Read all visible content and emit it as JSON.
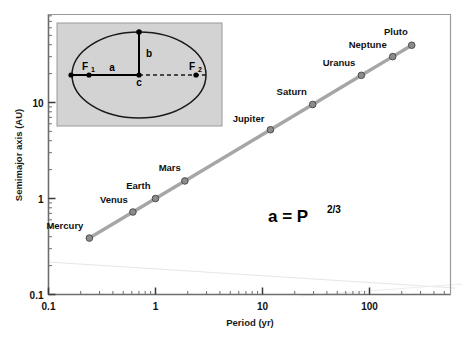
{
  "chart_data": {
    "type": "scatter",
    "title": "",
    "xlabel": "Period (yr)",
    "ylabel": "Semimajor axis (AU)",
    "xscale": "log",
    "yscale": "log",
    "xlim": [
      0.1,
      300
    ],
    "ylim": [
      0.1,
      60
    ],
    "grid": false,
    "legend": null,
    "annotations": [
      {
        "name": "kepler-law",
        "base": "a = P",
        "exponent": "2/3"
      }
    ],
    "xticks": [
      {
        "value": 0.1,
        "label": "0.1"
      },
      {
        "value": 1,
        "label": "1"
      },
      {
        "value": 10,
        "label": "10"
      },
      {
        "value": 100,
        "label": "100"
      }
    ],
    "yticks": [
      {
        "value": 0.1,
        "label": "0.1"
      },
      {
        "value": 1,
        "label": "1"
      },
      {
        "value": 10,
        "label": "10"
      }
    ],
    "series": [
      {
        "name": "Planets",
        "points": [
          {
            "label": "Mercury",
            "x": 0.241,
            "y": 0.387
          },
          {
            "label": "Venus",
            "x": 0.615,
            "y": 0.723
          },
          {
            "label": "Earth",
            "x": 1.0,
            "y": 1.0
          },
          {
            "label": "Mars",
            "x": 1.881,
            "y": 1.524
          },
          {
            "label": "Jupiter",
            "x": 11.86,
            "y": 5.203
          },
          {
            "label": "Saturn",
            "x": 29.46,
            "y": 9.537
          },
          {
            "label": "Uranus",
            "x": 84.01,
            "y": 19.19
          },
          {
            "label": "Neptune",
            "x": 164.8,
            "y": 30.07
          },
          {
            "label": "Pluto",
            "x": 248.1,
            "y": 39.48
          }
        ]
      }
    ]
  },
  "inset": {
    "name": "ellipse-diagram",
    "labels": {
      "semimajor": "a",
      "semiminor": "b",
      "center": "c",
      "focus1": "F",
      "focus1_sub": "1",
      "focus2": "F",
      "focus2_sub": "2"
    },
    "background_color": "#d3d3d3",
    "border_color": "#9a9a9a"
  },
  "style": {
    "line_color": "#a6a6a6",
    "marker_fill": "#8c8c8c",
    "marker_edge": "#4d4d4d",
    "axis_color": "#6e6e6e",
    "text_color": "#111111",
    "artifact_color": "#e4e4e4"
  }
}
